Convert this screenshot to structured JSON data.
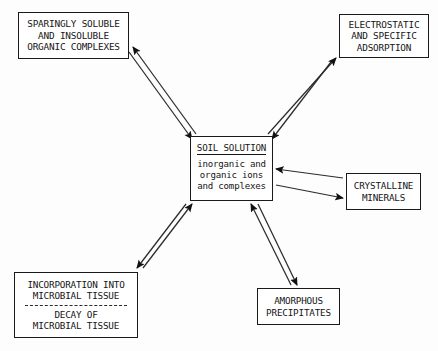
{
  "diagram": {
    "background_color": "#fdfdfd",
    "stroke_color": "#1a1a1a",
    "nodes": {
      "organic_complexes": {
        "lines": [
          "SPARINGLY SOLUBLE",
          "AND INSOLUBLE",
          "ORGANIC COMPLEXES"
        ]
      },
      "electrostatic": {
        "lines": [
          "ELECTROSTATIC",
          "AND SPECIFIC",
          "ADSORPTION"
        ]
      },
      "soil_solution": {
        "title": "SOIL SOLUTION",
        "lines": [
          "inorganic and",
          "organic ions",
          "and complexes"
        ]
      },
      "crystalline": {
        "lines": [
          "CRYSTALLINE",
          "MINERALS"
        ]
      },
      "microbial": {
        "lines_top": [
          "INCORPORATION INTO",
          "MICROBIAL TISSUE"
        ],
        "divider": "dashed",
        "lines_bottom": [
          "DECAY OF",
          "MICROBIAL TISSUE"
        ]
      },
      "amorphous": {
        "lines": [
          "AMORPHOUS",
          "PRECIPITATES"
        ]
      }
    },
    "connectors": [
      {
        "name": "soil-solution-to-organic-complexes",
        "from": "soil_solution",
        "to": "organic_complexes",
        "style": "double-line-bidirectional",
        "outbound": {
          "x1": 196,
          "y1": 134,
          "x2": 133,
          "y2": 47
        },
        "inbound": {
          "x1": 129,
          "y1": 52,
          "x2": 192,
          "y2": 139
        }
      },
      {
        "name": "soil-solution-to-electrostatic",
        "from": "soil_solution",
        "to": "electrostatic",
        "style": "double-line-bidirectional",
        "outbound": {
          "x1": 268,
          "y1": 134,
          "x2": 336,
          "y2": 58
        },
        "inbound": {
          "x1": 331,
          "y1": 62,
          "x2": 272,
          "y2": 139
        }
      },
      {
        "name": "soil-solution-to-crystalline",
        "from": "soil_solution",
        "to": "crystalline",
        "style": "double-line-bidirectional",
        "outbound": {
          "x1": 276,
          "y1": 185,
          "x2": 343,
          "y2": 198
        },
        "inbound": {
          "x1": 343,
          "y1": 178,
          "x2": 276,
          "y2": 169
        }
      },
      {
        "name": "soil-solution-to-amorphous",
        "from": "soil_solution",
        "to": "amorphous",
        "style": "double-line-bidirectional",
        "outbound": {
          "x1": 258,
          "y1": 204,
          "x2": 297,
          "y2": 285
        },
        "inbound": {
          "x1": 291,
          "y1": 285,
          "x2": 251,
          "y2": 204
        }
      },
      {
        "name": "soil-solution-to-microbial",
        "from": "soil_solution",
        "to": "microbial",
        "style": "double-line-bidirectional",
        "outbound": {
          "x1": 186,
          "y1": 204,
          "x2": 137,
          "y2": 268
        },
        "inbound": {
          "x1": 143,
          "y1": 268,
          "x2": 192,
          "y2": 204
        }
      }
    ]
  }
}
